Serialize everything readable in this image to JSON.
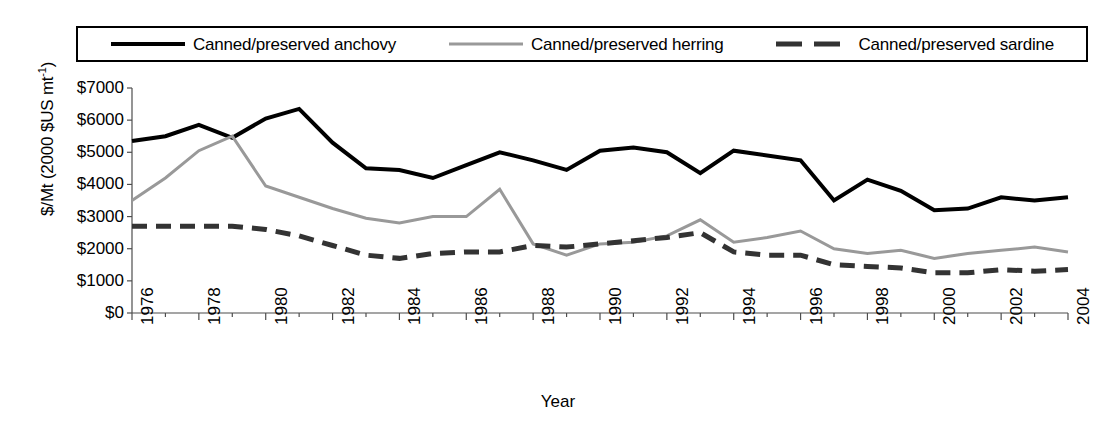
{
  "chart_data": {
    "type": "line",
    "title": "",
    "xlabel": "Year",
    "ylabel": "$/Mt (2000 $US mt-1)",
    "ylabel_main": "$/Mt (2000 $US mt",
    "ylabel_sup": "-1",
    "ylabel_close": ")",
    "xlim": [
      1976,
      2004
    ],
    "ylim": [
      0,
      7000
    ],
    "ytick_labels": [
      "$7000",
      "$6000",
      "$5000",
      "$4000",
      "$3000",
      "$2000",
      "$1000",
      "$0"
    ],
    "ytick_values": [
      7000,
      6000,
      5000,
      4000,
      3000,
      2000,
      1000,
      0
    ],
    "xtick_labels": [
      "1976",
      "1978",
      "1980",
      "1982",
      "1984",
      "1986",
      "1988",
      "1990",
      "1992",
      "1994",
      "1996",
      "1998",
      "2000",
      "2002",
      "2004"
    ],
    "xtick_values": [
      1976,
      1978,
      1980,
      1982,
      1984,
      1986,
      1988,
      1990,
      1992,
      1994,
      1996,
      1998,
      2000,
      2002,
      2004
    ],
    "x": [
      1976,
      1977,
      1978,
      1979,
      1980,
      1981,
      1982,
      1983,
      1984,
      1985,
      1986,
      1987,
      1988,
      1989,
      1990,
      1991,
      1992,
      1993,
      1994,
      1995,
      1996,
      1997,
      1998,
      1999,
      2000,
      2001,
      2002,
      2003,
      2004
    ],
    "grid": false,
    "legend_position": "top",
    "series": [
      {
        "name": "Canned/preserved anchovy",
        "color": "#000000",
        "style": "solid",
        "width": 4,
        "values": [
          5350,
          5500,
          5850,
          5450,
          6050,
          6350,
          5300,
          4500,
          4450,
          4200,
          4600,
          5000,
          4750,
          4450,
          5050,
          5150,
          5000,
          4350,
          5050,
          4900,
          4750,
          3500,
          4150,
          3800,
          3200,
          3250,
          3600,
          3500,
          3600
        ]
      },
      {
        "name": "Canned/preserved herring",
        "color": "#999999",
        "style": "solid",
        "width": 3,
        "values": [
          3500,
          4200,
          5050,
          5500,
          3950,
          3600,
          3250,
          2950,
          2800,
          3000,
          3000,
          3850,
          2150,
          1800,
          2150,
          2200,
          2400,
          2900,
          2200,
          2350,
          2550,
          2000,
          1850,
          1950,
          1700,
          1850,
          1950,
          2050,
          1900
        ]
      },
      {
        "name": "Canned/preserved sardine",
        "color": "#333333",
        "style": "dashed",
        "width": 5,
        "values": [
          2700,
          2700,
          2700,
          2700,
          2600,
          2400,
          2100,
          1800,
          1700,
          1850,
          1900,
          1900,
          2100,
          2050,
          2150,
          2250,
          2350,
          2500,
          1900,
          1800,
          1800,
          1500,
          1450,
          1400,
          1250,
          1250,
          1350,
          1300,
          1350
        ]
      }
    ]
  },
  "legend": {
    "entries": [
      {
        "label": "Canned/preserved anchovy"
      },
      {
        "label": "Canned/preserved herring"
      },
      {
        "label": "Canned/preserved sardine"
      }
    ]
  }
}
